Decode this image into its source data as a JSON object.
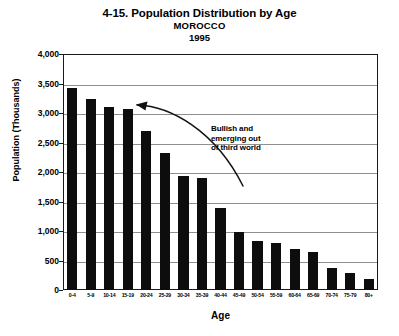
{
  "chart_data": {
    "type": "bar",
    "title": "4-15. Population Distribution by Age",
    "subtitle": "MOROCCO",
    "year": "1995",
    "xlabel": "Age",
    "ylabel": "Population (Thousands)",
    "ylim": [
      0,
      4000
    ],
    "ytick_labels": [
      "4,000",
      "3,500",
      "3,000",
      "2,500",
      "2,000",
      "1,500",
      "1,000",
      "500",
      "0"
    ],
    "ytick_values": [
      4000,
      3500,
      3000,
      2500,
      2000,
      1500,
      1000,
      500,
      0
    ],
    "grid": true,
    "legend": "none",
    "bar_color": "#0d0d0d",
    "categories": [
      "0-4",
      "5-9",
      "10-14",
      "15-19",
      "20-24",
      "25-29",
      "30-34",
      "35-39",
      "40-44",
      "45-49",
      "50-54",
      "55-59",
      "60-64",
      "65-69",
      "70-74",
      "75-79",
      "80+"
    ],
    "values": [
      3420,
      3230,
      3110,
      3060,
      2690,
      2330,
      1940,
      1900,
      1390,
      980,
      830,
      800,
      700,
      640,
      370,
      280,
      190
    ],
    "annotations": [
      {
        "text": "Bullish and emerging out of third world",
        "lines": [
          "Bullish and",
          "emerging out",
          "of third world"
        ],
        "arrow": "curved-arrow-pointing-upper-left"
      }
    ]
  }
}
